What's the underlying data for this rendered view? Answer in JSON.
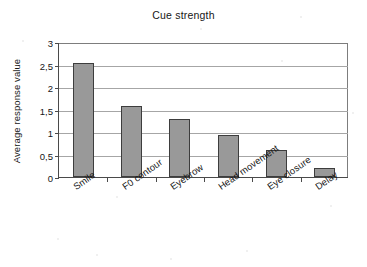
{
  "chart_data": {
    "type": "bar",
    "title": "Cue strength",
    "xlabel": "",
    "ylabel": "Average response value",
    "categories": [
      "Smile",
      "F0 contour",
      "Eyebrow",
      "Head movement",
      "Eye closure",
      "Delay"
    ],
    "values": [
      2.53,
      1.58,
      1.29,
      0.93,
      0.6,
      0.19
    ],
    "ylim": [
      0,
      3
    ],
    "ytick_values": [
      0,
      0.5,
      1,
      1.5,
      2,
      2.5,
      3
    ],
    "ytick_labels": [
      "0",
      "0,5",
      "1",
      "1,5",
      "2",
      "2,5",
      "3"
    ],
    "grid": true,
    "grid_axis": "y",
    "legend": false,
    "legend_position": "none",
    "series": [
      {
        "name": "Cue strength",
        "values": [
          2.53,
          1.58,
          1.29,
          0.93,
          0.6,
          0.19
        ]
      }
    ],
    "bar_color": "#999999",
    "bar_border_color": "#3d3d3d",
    "axis_color": "#4a4a4a",
    "grid_color": "#a6a6a6",
    "background_color": "#ffffff",
    "decimal_separator": ","
  }
}
